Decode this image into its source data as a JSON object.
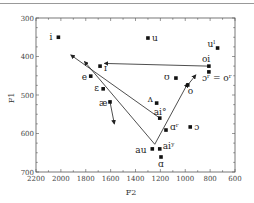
{
  "chart_data": {
    "type": "scatter",
    "title": "",
    "xlabel": "F2",
    "ylabel": "F1",
    "xlim": [
      2200,
      600
    ],
    "ylim": [
      300,
      700
    ],
    "x_reversed": true,
    "y_reversed": true,
    "x_ticks": [
      "2200",
      "2000",
      "1800",
      "1600",
      "1400",
      "1200",
      "1000",
      "800",
      "600"
    ],
    "y_ticks": [
      "300",
      "400",
      "500",
      "600",
      "700"
    ],
    "grid": false,
    "legend": null,
    "points": [
      {
        "label": "i",
        "F2": 2020,
        "F1": 350
      },
      {
        "label": "u",
        "F2": 1300,
        "F1": 352
      },
      {
        "label": "uˡ",
        "F2": 740,
        "F1": 378
      },
      {
        "label": "oi",
        "F2": 810,
        "F1": 425
      },
      {
        "label": "ɔʳ = oʳ",
        "F2": 810,
        "F1": 440
      },
      {
        "label": "ʊ",
        "F2": 1075,
        "F1": 456
      },
      {
        "label": "o",
        "F2": 980,
        "F1": 474
      },
      {
        "label": "ɪ",
        "F2": 1685,
        "F1": 425
      },
      {
        "label": "e",
        "F2": 1760,
        "F1": 451
      },
      {
        "label": "ɛ",
        "F2": 1660,
        "F1": 484
      },
      {
        "label": "æ",
        "F2": 1605,
        "F1": 518
      },
      {
        "label": "ʌ",
        "F2": 1230,
        "F1": 521
      },
      {
        "label": "ai°",
        "F2": 1205,
        "F1": 560
      },
      {
        "label": "ɑʳ",
        "F2": 1155,
        "F1": 591
      },
      {
        "label": "ɔ",
        "F2": 960,
        "F1": 583
      },
      {
        "label": "au",
        "F2": 1265,
        "F1": 640
      },
      {
        "label": "aiʸ",
        "F2": 1205,
        "F1": 640
      },
      {
        "label": "ɑ",
        "F2": 1195,
        "F1": 661
      }
    ],
    "annotations": [
      {
        "type": "arrow",
        "from": {
          "F2": 810,
          "F1": 425
        },
        "to": {
          "F2": 1650,
          "F1": 418
        },
        "note": "oi glide toward ɪ"
      },
      {
        "type": "arrow",
        "from": {
          "F2": 1205,
          "F1": 560
        },
        "to": {
          "F2": 1920,
          "F1": 396
        },
        "note": "ai° glide toward front"
      },
      {
        "type": "arrow",
        "from": {
          "F2": 1245,
          "F1": 628
        },
        "to": {
          "F2": 1810,
          "F1": 413
        },
        "note": "aiʸ glide toward e"
      },
      {
        "type": "arrow",
        "from": {
          "F2": 1245,
          "F1": 628
        },
        "to": {
          "F2": 980,
          "F1": 470
        },
        "note": "au glide toward o"
      },
      {
        "type": "arrow",
        "from": {
          "F2": 1605,
          "F1": 518
        },
        "to": {
          "F2": 1570,
          "F1": 575
        },
        "note": "æ offglide"
      },
      {
        "type": "arrow",
        "from": {
          "F2": 980,
          "F1": 474
        },
        "to": {
          "F2": 915,
          "F1": 448
        },
        "note": "o offglide"
      }
    ]
  }
}
